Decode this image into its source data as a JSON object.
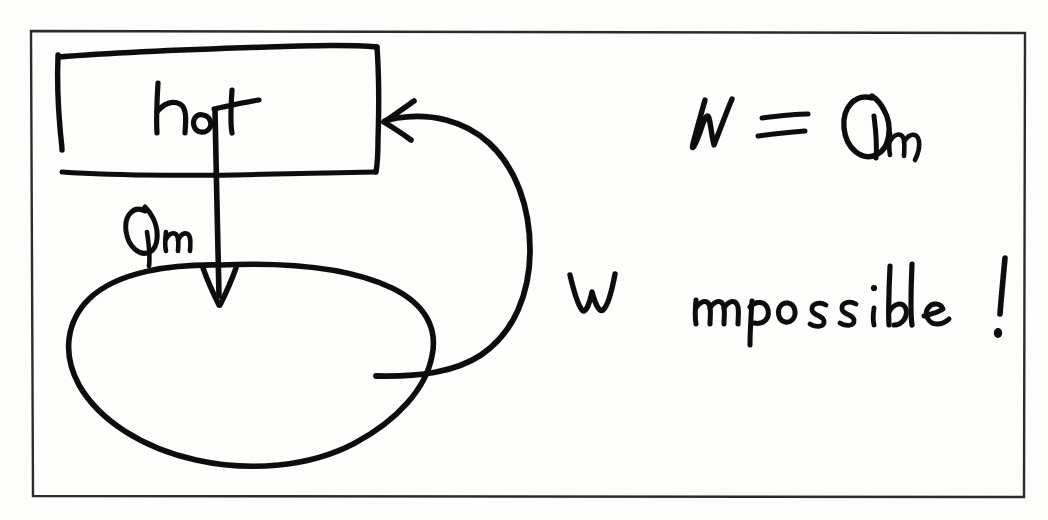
{
  "figure": {
    "description": "Sketch of a heat engine drawing heat Qin from a hot reservoir and converting all of it to work W, which is fed back to the hot reservoir.",
    "ink_color": "#0d0d0d",
    "paper_color": "#fdfdfc",
    "frame_color": "#2b2b2b",
    "top_text_remnant": "partially cropped printed line"
  },
  "frame": {
    "name": "figure-border",
    "x": 31,
    "y": 31,
    "width": 994,
    "height": 466
  },
  "reservoir_box": {
    "label": "hot",
    "x": 57,
    "y": 50,
    "width": 321,
    "height": 120
  },
  "heat_arrow": {
    "label": "Qin",
    "label_display": "Q",
    "label_subscript": "in",
    "direction": "down",
    "from": "hot reservoir",
    "to": "engine"
  },
  "engine": {
    "shape": "blob",
    "label": ""
  },
  "work_arrow": {
    "label": "W",
    "direction": "curved left into hot reservoir",
    "from": "engine",
    "to": "hot reservoir"
  },
  "annotations": {
    "equation": "W = Qin",
    "equation_lhs": "W",
    "equation_operator": "=",
    "equation_rhs_symbol": "Q",
    "equation_rhs_subscript": "in",
    "verdict": "impossible!"
  }
}
